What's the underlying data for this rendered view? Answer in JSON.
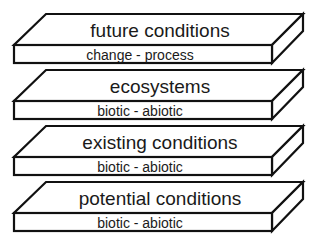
{
  "diagram": {
    "type": "stacked-layers",
    "layers": [
      {
        "title": "future conditions",
        "subtitle": "change - process"
      },
      {
        "title": "ecosystems",
        "subtitle": "biotic - abiotic"
      },
      {
        "title": "existing conditions",
        "subtitle": "biotic - abiotic"
      },
      {
        "title": "potential conditions",
        "subtitle": "biotic - abiotic"
      }
    ]
  }
}
